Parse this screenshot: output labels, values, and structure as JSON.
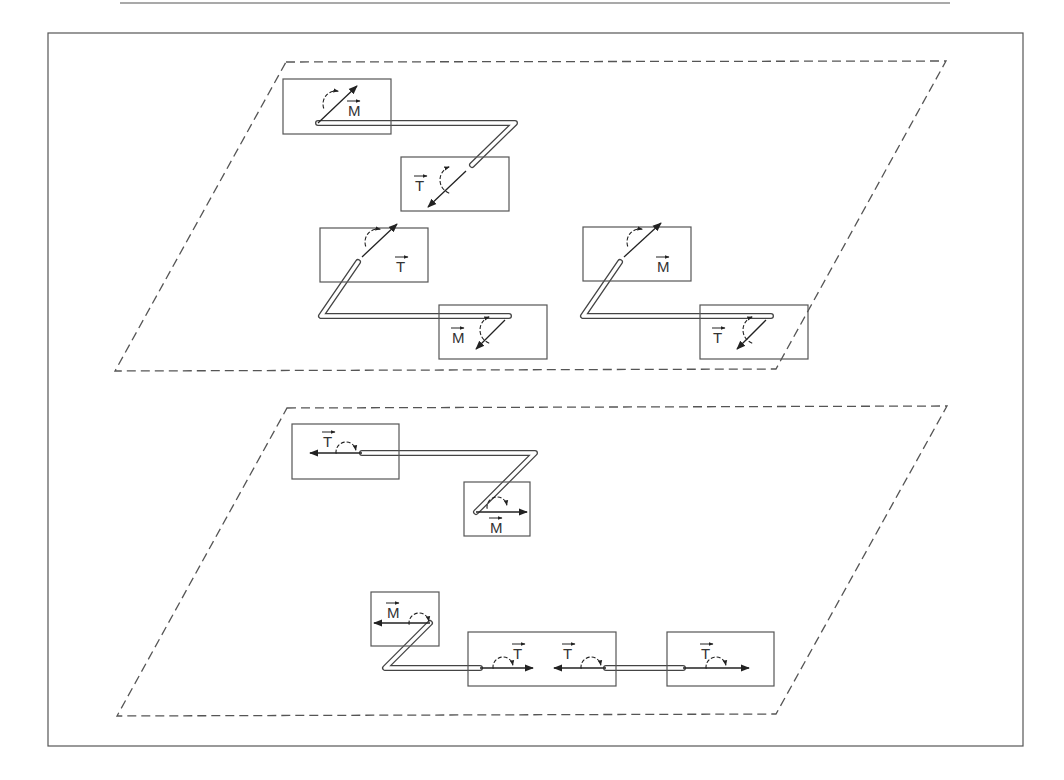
{
  "colors": {
    "line": "#555555",
    "ink": "#222222",
    "background": "#ffffff"
  },
  "header_rule": {
    "x1": 120,
    "x2": 950,
    "y": 3
  },
  "outer_frame": {
    "x": 48,
    "y": 33,
    "w": 975,
    "h": 713
  },
  "planes": [
    {
      "name": "upper-plane",
      "points": [
        [
          286,
          62
        ],
        [
          946,
          61
        ],
        [
          776,
          369
        ],
        [
          115,
          371
        ]
      ]
    },
    {
      "name": "lower-plane",
      "points": [
        [
          287,
          408
        ],
        [
          947,
          406
        ],
        [
          776,
          714
        ],
        [
          117,
          716
        ]
      ]
    }
  ],
  "boxes": [
    {
      "name": "box-upper-a1",
      "x": 283,
      "y": 79,
      "w": 108,
      "h": 55
    },
    {
      "name": "box-upper-a2",
      "x": 401,
      "y": 157,
      "w": 108,
      "h": 54
    },
    {
      "name": "box-upper-b1",
      "x": 320,
      "y": 228,
      "w": 108,
      "h": 54
    },
    {
      "name": "box-upper-b2",
      "x": 439,
      "y": 305,
      "w": 108,
      "h": 54
    },
    {
      "name": "box-upper-c1",
      "x": 583,
      "y": 227,
      "w": 108,
      "h": 54
    },
    {
      "name": "box-upper-c2",
      "x": 700,
      "y": 305,
      "w": 108,
      "h": 54
    },
    {
      "name": "box-lower-a1",
      "x": 292,
      "y": 424,
      "w": 107,
      "h": 55
    },
    {
      "name": "box-lower-a2",
      "x": 464,
      "y": 482,
      "w": 66,
      "h": 54
    },
    {
      "name": "box-lower-b1",
      "x": 371,
      "y": 592,
      "w": 68,
      "h": 54
    },
    {
      "name": "box-lower-b2",
      "x": 468,
      "y": 632,
      "w": 148,
      "h": 54
    },
    {
      "name": "box-lower-b3",
      "x": 667,
      "y": 632,
      "w": 107,
      "h": 54
    }
  ],
  "tubes": [
    {
      "name": "tube-upper-a",
      "points": [
        [
          318,
          123
        ],
        [
          515,
          123
        ],
        [
          472,
          165
        ]
      ]
    },
    {
      "name": "tube-upper-b",
      "points": [
        [
          358,
          262
        ],
        [
          321,
          316
        ],
        [
          509,
          316
        ]
      ]
    },
    {
      "name": "tube-upper-c",
      "points": [
        [
          620,
          262
        ],
        [
          583,
          316
        ],
        [
          771,
          316
        ]
      ]
    },
    {
      "name": "tube-lower-a",
      "points": [
        [
          362,
          453
        ],
        [
          535,
          453
        ],
        [
          476,
          512
        ]
      ]
    },
    {
      "name": "tube-lower-b",
      "points": [
        [
          430,
          623
        ],
        [
          385,
          668
        ],
        [
          480,
          668
        ]
      ]
    },
    {
      "name": "tube-lower-c",
      "points": [
        [
          606,
          668
        ],
        [
          683,
          668
        ]
      ]
    }
  ],
  "arrows": [
    {
      "name": "arrow-upper-a1",
      "x1": 318,
      "y1": 123,
      "x2": 357,
      "y2": 86
    },
    {
      "name": "arrow-upper-a2",
      "x1": 466,
      "y1": 171,
      "x2": 428,
      "y2": 207
    },
    {
      "name": "arrow-upper-b1",
      "x1": 362,
      "y1": 257,
      "x2": 397,
      "y2": 224
    },
    {
      "name": "arrow-upper-b2",
      "x1": 505,
      "y1": 320,
      "x2": 476,
      "y2": 349
    },
    {
      "name": "arrow-upper-c1",
      "x1": 624,
      "y1": 257,
      "x2": 661,
      "y2": 223
    },
    {
      "name": "arrow-upper-c2",
      "x1": 766,
      "y1": 320,
      "x2": 737,
      "y2": 349
    },
    {
      "name": "arrow-lower-a1",
      "x1": 362,
      "y1": 453,
      "x2": 310,
      "y2": 453
    },
    {
      "name": "arrow-lower-a2",
      "x1": 476,
      "y1": 512,
      "x2": 527,
      "y2": 512
    },
    {
      "name": "arrow-lower-b1",
      "x1": 430,
      "y1": 623,
      "x2": 374,
      "y2": 623
    },
    {
      "name": "arrow-lower-b2",
      "x1": 480,
      "y1": 668,
      "x2": 533,
      "y2": 668
    },
    {
      "name": "arrow-lower-b3",
      "x1": 606,
      "y1": 668,
      "x2": 554,
      "y2": 668
    },
    {
      "name": "arrow-lower-b4",
      "x1": 683,
      "y1": 668,
      "x2": 749,
      "y2": 668
    }
  ],
  "moments": [
    {
      "name": "moment-arc-upper-a1",
      "cx": 336,
      "cy": 104,
      "r": 13,
      "start": 200,
      "end": 80
    },
    {
      "name": "moment-arc-upper-a2",
      "cx": 454,
      "cy": 180,
      "r": 14,
      "start": 250,
      "end": 110
    },
    {
      "name": "moment-arc-upper-b1",
      "cx": 378,
      "cy": 242,
      "r": 13,
      "start": 200,
      "end": 80
    },
    {
      "name": "moment-arc-upper-b2",
      "cx": 494,
      "cy": 330,
      "r": 14,
      "start": 250,
      "end": 110
    },
    {
      "name": "moment-arc-upper-c1",
      "cx": 640,
      "cy": 242,
      "r": 13,
      "start": 200,
      "end": 80
    },
    {
      "name": "moment-arc-upper-c2",
      "cx": 757,
      "cy": 330,
      "r": 14,
      "start": 250,
      "end": 110
    },
    {
      "name": "moment-arc-lower-a1",
      "cx": 346,
      "cy": 452,
      "r": 10,
      "start": 190,
      "end": 10
    },
    {
      "name": "moment-arc-lower-a2",
      "cx": 497,
      "cy": 507,
      "r": 10,
      "start": 190,
      "end": 10
    },
    {
      "name": "moment-arc-lower-b1",
      "cx": 419,
      "cy": 623,
      "r": 10,
      "start": 190,
      "end": 10
    },
    {
      "name": "moment-arc-lower-b2",
      "cx": 503,
      "cy": 667,
      "r": 10,
      "start": 190,
      "end": 10
    },
    {
      "name": "moment-arc-lower-b3",
      "cx": 591,
      "cy": 667,
      "r": 10,
      "start": 190,
      "end": 10
    },
    {
      "name": "moment-arc-lower-b4",
      "cx": 716,
      "cy": 667,
      "r": 10,
      "start": 190,
      "end": 10
    }
  ],
  "labels": [
    {
      "name": "label-upper-a1",
      "text": "M",
      "x": 348,
      "y": 116
    },
    {
      "name": "label-upper-a2",
      "text": "T",
      "x": 415,
      "y": 191
    },
    {
      "name": "label-upper-b1",
      "text": "T",
      "x": 396,
      "y": 272
    },
    {
      "name": "label-upper-b2",
      "text": "M",
      "x": 452,
      "y": 343
    },
    {
      "name": "label-upper-c1",
      "text": "M",
      "x": 657,
      "y": 272
    },
    {
      "name": "label-upper-c2",
      "text": "T",
      "x": 713,
      "y": 343
    },
    {
      "name": "label-lower-a1",
      "text": "T",
      "x": 323,
      "y": 447
    },
    {
      "name": "label-lower-a2",
      "text": "M",
      "x": 490,
      "y": 533
    },
    {
      "name": "label-lower-b1",
      "text": "M",
      "x": 387,
      "y": 618
    },
    {
      "name": "label-lower-b2",
      "text": "T",
      "x": 513,
      "y": 659
    },
    {
      "name": "label-lower-b3",
      "text": "T",
      "x": 563,
      "y": 659
    },
    {
      "name": "label-lower-b4",
      "text": "T",
      "x": 701,
      "y": 659
    }
  ]
}
